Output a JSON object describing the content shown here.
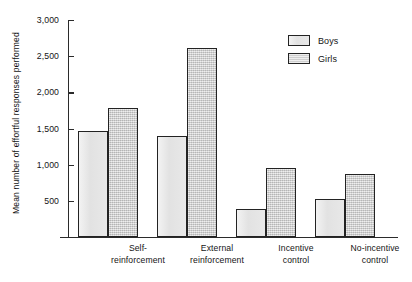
{
  "chart_data": {
    "type": "bar",
    "title": "",
    "subtitle": "",
    "xlabel": "",
    "ylabel": "Mean number of effortful responses performed",
    "categories": [
      "Self-\nreinforcement",
      "External\nreinforcement",
      "Incentive\ncontrol",
      "No-incentive\ncontrol"
    ],
    "category_lines": [
      [
        "Self-",
        "reinforcement"
      ],
      [
        "External",
        "reinforcement"
      ],
      [
        "Incentive",
        "control"
      ],
      [
        "No-incentive",
        "control"
      ]
    ],
    "series": [
      {
        "name": "Boys",
        "values": [
          1460,
          1390,
          390,
          530
        ]
      },
      {
        "name": "Girls",
        "values": [
          1780,
          2620,
          960,
          870
        ]
      }
    ],
    "ylim": [
      0,
      3000
    ],
    "yticks": [
      500,
      1000,
      1500,
      2000,
      2500,
      3000
    ],
    "ytick_labels": [
      "500",
      "1,000",
      "1,500",
      "2,000",
      "2,500",
      "3,000"
    ],
    "grid": false,
    "legend_position": "top-right",
    "colors": {
      "boys_fill": "#e7e7e7",
      "girls_fill": "#cfcfcf",
      "bar_outline": "#232323",
      "axis": "#2b2b2b",
      "text": "#141414",
      "background": "#ffffff"
    }
  },
  "legend": {
    "entries": [
      {
        "label": "Boys",
        "swatch": "boys-swatch"
      },
      {
        "label": "Girls",
        "swatch": "girls-swatch"
      }
    ]
  }
}
